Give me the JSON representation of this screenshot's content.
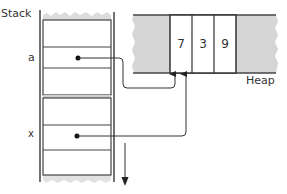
{
  "diagram": {
    "stack": {
      "title": "Stack",
      "variables": [
        {
          "name": "a",
          "points_to": "heap-cell-0"
        },
        {
          "name": "x",
          "points_to": "heap-cell-0"
        }
      ],
      "growth_direction": "down"
    },
    "heap": {
      "title": "Heap",
      "cells": [
        {
          "value": "7"
        },
        {
          "value": "3"
        },
        {
          "value": "9"
        }
      ]
    },
    "colors": {
      "line": "#333333",
      "fill_gray": "#d9d9d9",
      "background": "#ffffff"
    }
  }
}
